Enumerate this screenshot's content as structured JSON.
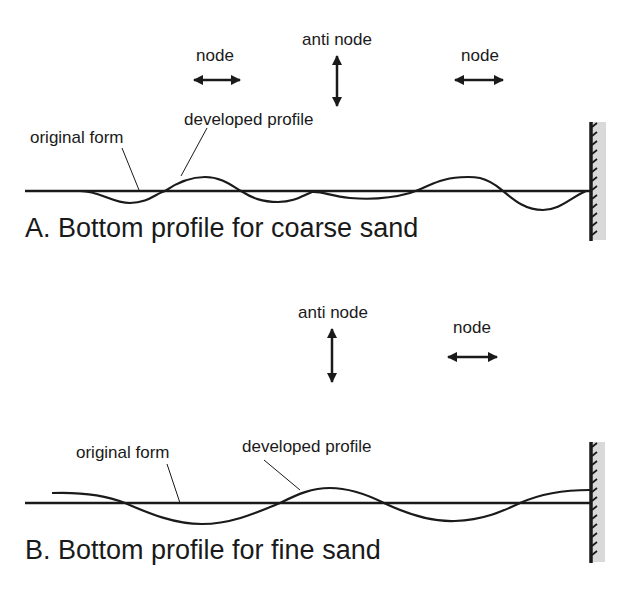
{
  "colors": {
    "ink": "#1a1a1a",
    "wall_shade": "#d9d9d9",
    "background": "#ffffff"
  },
  "panel_a": {
    "title": "A. Bottom profile for coarse sand",
    "labels": {
      "node_left": "node",
      "anti_node": "anti node",
      "node_right": "node",
      "original_form": "original form",
      "developed_profile": "developed profile"
    },
    "icons": {
      "node_left": "double-arrow-horizontal-icon",
      "anti_node": "double-arrow-vertical-icon",
      "node_right": "double-arrow-horizontal-icon",
      "wall": "hatched-wall-icon"
    }
  },
  "panel_b": {
    "title": "B. Bottom profile for fine sand",
    "labels": {
      "anti_node": "anti node",
      "node_right": "node",
      "original_form": "original form",
      "developed_profile": "developed profile"
    },
    "icons": {
      "anti_node": "double-arrow-vertical-icon",
      "node_right": "double-arrow-horizontal-icon",
      "wall": "hatched-wall-icon"
    }
  }
}
